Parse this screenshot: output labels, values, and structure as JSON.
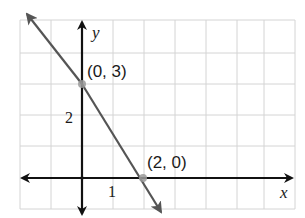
{
  "graph": {
    "axis_labels": {
      "x": "x",
      "y": "y"
    },
    "tick_labels": {
      "x_1": "1",
      "y_2": "2"
    },
    "points": [
      {
        "label": "(0, 3)",
        "x": 0,
        "y": 3
      },
      {
        "label": "(2, 0)",
        "x": 2,
        "y": 0
      }
    ],
    "line": {
      "slope": -1.5,
      "y_intercept": 3,
      "x_intercept": 2
    },
    "colors": {
      "grid": "#d0d0d0",
      "axes": "#111111",
      "line": "#555555",
      "point": "#9a9a9a"
    }
  }
}
